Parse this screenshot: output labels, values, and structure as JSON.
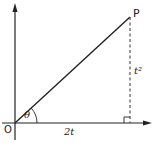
{
  "diagram": {
    "title": "",
    "labels": {
      "point_p": "P",
      "origin": "O",
      "angle": "θ",
      "horizontal_length": "2t",
      "vertical_length": "t²"
    },
    "colors": {
      "line": "#222222",
      "background": "#ffffff"
    },
    "geometry": {
      "origin": [
        15,
        123
      ],
      "point_p": [
        130,
        17
      ],
      "foot": [
        130,
        123
      ]
    }
  }
}
